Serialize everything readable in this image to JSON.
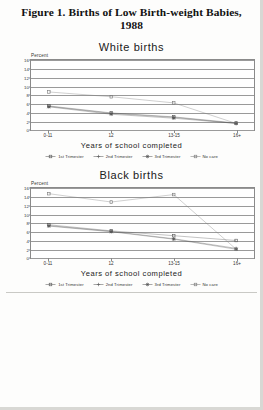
{
  "figure": {
    "title": "Figure 1. Births of Low Birth-weight Babies, 1988"
  },
  "panels": [
    {
      "id": "white-births",
      "title": "White births"
    },
    {
      "id": "black-births",
      "title": "Black births"
    }
  ],
  "axis": {
    "ylabel": "Percent",
    "xlabel": "Years of school completed"
  },
  "legend": {
    "items": [
      {
        "label": "1st Trimester",
        "marker": "dash-square",
        "color": "#555555"
      },
      {
        "label": "2nd Trimester",
        "marker": "plus",
        "color": "#555555"
      },
      {
        "label": "3rd Trimester",
        "marker": "star",
        "color": "#555555"
      },
      {
        "label": "No care",
        "marker": "open-square",
        "color": "#777777"
      }
    ]
  },
  "chart_data": [
    {
      "type": "line",
      "title": "White births",
      "xlabel": "Years of school completed",
      "ylabel": "Percent",
      "categories": [
        "0-11",
        "12",
        "13-15",
        "16+"
      ],
      "ylim": [
        0,
        16
      ],
      "yticks": [
        0,
        2,
        4,
        6,
        8,
        10,
        12,
        14,
        16
      ],
      "grid": true,
      "legend_position": "bottom",
      "series": [
        {
          "name": "1st Trimester",
          "values": [
            5.5,
            3.9,
            3.0,
            1.6
          ]
        },
        {
          "name": "2nd Trimester",
          "values": [
            5.4,
            3.8,
            2.9,
            1.5
          ]
        },
        {
          "name": "3rd Trimester",
          "values": [
            5.3,
            3.6,
            2.7,
            1.5
          ]
        },
        {
          "name": "No care",
          "values": [
            8.7,
            7.6,
            6.2,
            1.5
          ]
        }
      ]
    },
    {
      "type": "line",
      "title": "Black births",
      "xlabel": "Years of school completed",
      "ylabel": "Percent",
      "categories": [
        "0-11",
        "12",
        "13-15",
        "16+"
      ],
      "ylim": [
        0,
        16
      ],
      "yticks": [
        0,
        2,
        4,
        6,
        8,
        10,
        12,
        14,
        16
      ],
      "grid": true,
      "legend_position": "bottom",
      "series": [
        {
          "name": "1st Trimester",
          "values": [
            7.6,
            6.2,
            5.1,
            4.0
          ]
        },
        {
          "name": "2nd Trimester",
          "values": [
            7.4,
            6.1,
            4.4,
            2.2
          ]
        },
        {
          "name": "3rd Trimester",
          "values": [
            7.3,
            6.0,
            4.3,
            2.0
          ]
        },
        {
          "name": "No care",
          "values": [
            14.7,
            12.8,
            14.5,
            2.0
          ]
        }
      ]
    }
  ]
}
